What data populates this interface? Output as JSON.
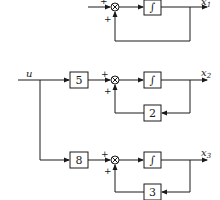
{
  "diagram": {
    "input_label": "u",
    "integrator_symbol": "∫",
    "summing_signs": {
      "top": "+",
      "bottom": "+"
    },
    "rows": [
      {
        "id": "row1",
        "gain": null,
        "feedback_gain": null,
        "output_var": "x",
        "output_sub": "1"
      },
      {
        "id": "row2",
        "gain": "5",
        "feedback_gain": "2",
        "output_var": "x",
        "output_sub": "2"
      },
      {
        "id": "row3",
        "gain": "8",
        "feedback_gain": "3",
        "output_var": "x",
        "output_sub": "3"
      }
    ]
  }
}
